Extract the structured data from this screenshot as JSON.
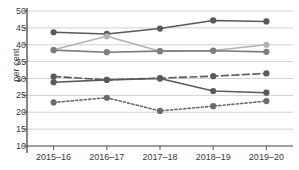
{
  "chart_data": {
    "type": "line",
    "title": "",
    "xlabel": "",
    "ylabel": "per cent",
    "categories": [
      "2015–16",
      "2016–17",
      "2017–18",
      "2018–19",
      "2019–20"
    ],
    "ylim": [
      10,
      50
    ],
    "yticks": [
      10,
      15,
      20,
      25,
      30,
      35,
      40,
      45,
      50
    ],
    "ytick_labels": [
      "10",
      "15",
      "20",
      "25",
      "30",
      "35",
      "40",
      "45",
      "50"
    ],
    "grid": "horizontal",
    "legend": "none",
    "series": [
      {
        "name": "series-1",
        "values": [
          43.7,
          43.2,
          44.8,
          47.2,
          46.9
        ],
        "color": "#595959",
        "style": "solid",
        "marker": "circle"
      },
      {
        "name": "series-2",
        "values": [
          38.5,
          42.5,
          38.1,
          38.3,
          40.0
        ],
        "color": "#b3b3b3",
        "style": "solid",
        "marker": "circle"
      },
      {
        "name": "series-3",
        "values": [
          38.4,
          37.8,
          38.1,
          38.2,
          37.9
        ],
        "color": "#7d7d7d",
        "style": "solid",
        "marker": "circle"
      },
      {
        "name": "series-4",
        "values": [
          30.6,
          29.6,
          30.1,
          30.7,
          31.5
        ],
        "color": "#5a5a5a",
        "style": "dashed",
        "marker": "circle"
      },
      {
        "name": "series-5",
        "values": [
          28.9,
          29.6,
          30.0,
          26.3,
          25.8
        ],
        "color": "#5a5a5a",
        "style": "solid",
        "marker": "circle"
      },
      {
        "name": "series-6",
        "values": [
          22.9,
          24.3,
          20.4,
          21.8,
          23.3
        ],
        "color": "#6b6b6b",
        "style": "dotted",
        "marker": "circle"
      }
    ]
  },
  "colors": {
    "axis": "#555555",
    "grid": "#d2d2d2",
    "text": "#3a3a3a",
    "background": "#ffffff"
  }
}
